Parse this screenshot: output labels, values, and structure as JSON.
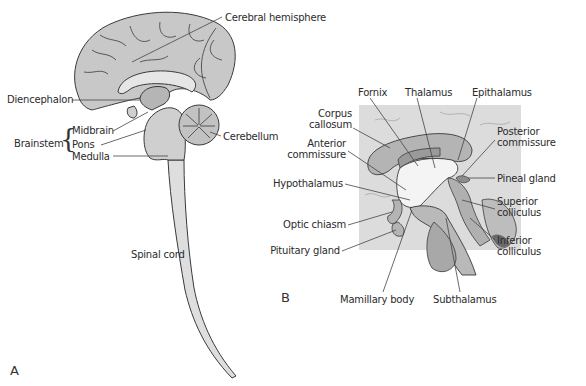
{
  "panels": {
    "a": {
      "letter": "A",
      "labels": {
        "cerebral_hemisphere": "Cerebral hemisphere",
        "diencephalon": "Diencephalon",
        "brainstem": "Brainstem",
        "midbrain": "Midbrain",
        "pons": "Pons",
        "medulla": "Medulla",
        "cerebellum": "Cerebellum",
        "spinal_cord": "Spinal cord"
      }
    },
    "b": {
      "letter": "B",
      "labels": {
        "fornix": "Fornix",
        "thalamus": "Thalamus",
        "epithalamus": "Epithalamus",
        "corpus_callosum_1": "Corpus",
        "corpus_callosum_2": "callosum",
        "anterior_commissure_1": "Anterior",
        "anterior_commissure_2": "commissure",
        "posterior_commissure_1": "Posterior",
        "posterior_commissure_2": "commissure",
        "hypothalamus": "Hypothalamus",
        "pineal_gland": "Pineal gland",
        "superior_colliculus_1": "Superior",
        "superior_colliculus_2": "colliculus",
        "optic_chiasm": "Optic chiasm",
        "inferior_colliculus_1": "Inferior",
        "inferior_colliculus_2": "colliculus",
        "pituitary_gland": "Pituitary gland",
        "mamillary_body": "Mamillary body",
        "subthalamus": "Subthalamus"
      }
    }
  },
  "colors": {
    "tissue_light": "#d6d6d6",
    "tissue_mid": "#b9b9b9",
    "tissue_dark": "#9a9a9a",
    "background_box": "#dcdcdc",
    "outline": "#3a3a3a",
    "leader": "#444444"
  }
}
